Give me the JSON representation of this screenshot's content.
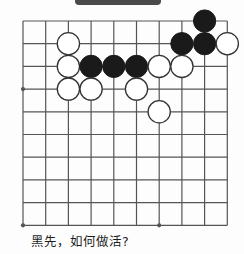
{
  "figure": {
    "kind": "go-problem-diagram",
    "caption": "黑先，如何做活?"
  },
  "topbar": {
    "label": "",
    "color": "#4a4a4a"
  },
  "board": {
    "columns": 10,
    "rows": 10,
    "cell_size": 22.7,
    "origin_x": 23,
    "origin_y": 21,
    "line_color": "#555555",
    "background_color": "#fdfdfd",
    "black_color": "#1a1a1a",
    "white_color": "#ffffff",
    "white_border_color": "#333333",
    "star_points": [
      {
        "col": 0,
        "row": 3
      },
      {
        "col": 0,
        "row": 9
      },
      {
        "col": 6,
        "row": 9
      }
    ],
    "stones": [
      {
        "color": "black",
        "col": 8,
        "row": 0
      },
      {
        "color": "white",
        "col": 2,
        "row": 1
      },
      {
        "color": "black",
        "col": 7,
        "row": 1
      },
      {
        "color": "black",
        "col": 8,
        "row": 1
      },
      {
        "color": "white",
        "col": 9,
        "row": 1
      },
      {
        "color": "white",
        "col": 2,
        "row": 2
      },
      {
        "color": "black",
        "col": 3,
        "row": 2
      },
      {
        "color": "black",
        "col": 4,
        "row": 2
      },
      {
        "color": "black",
        "col": 5,
        "row": 2
      },
      {
        "color": "white",
        "col": 6,
        "row": 2
      },
      {
        "color": "white",
        "col": 7,
        "row": 2
      },
      {
        "color": "white",
        "col": 2,
        "row": 3
      },
      {
        "color": "white",
        "col": 3,
        "row": 3
      },
      {
        "color": "white",
        "col": 5,
        "row": 3
      },
      {
        "color": "white",
        "col": 6,
        "row": 4
      }
    ]
  }
}
